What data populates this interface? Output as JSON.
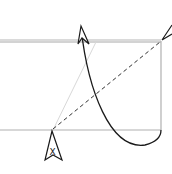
{
  "diagram": {
    "type": "origami-fold-instruction",
    "symbols": {
      "push_symbol_label": "X"
    },
    "colors": {
      "paper_edge": "#b0b0b0",
      "crease_line": "#d0d0d0",
      "dashed_fold": "#333333",
      "arrow": "#1a1a1a",
      "background": "#ffffff"
    },
    "elements": [
      {
        "id": "paper-top-edge",
        "kind": "double-line"
      },
      {
        "id": "paper-right-edge",
        "kind": "line"
      },
      {
        "id": "paper-bottom-edge",
        "kind": "line"
      },
      {
        "id": "valley-fold-line",
        "kind": "dashed-line"
      },
      {
        "id": "crease-line",
        "kind": "faint-line"
      },
      {
        "id": "fold-arrow",
        "kind": "curved-arrow"
      },
      {
        "id": "push-arrow",
        "kind": "hollow-arrow-with-label"
      },
      {
        "id": "corner-arrow",
        "kind": "arrowhead"
      }
    ]
  }
}
